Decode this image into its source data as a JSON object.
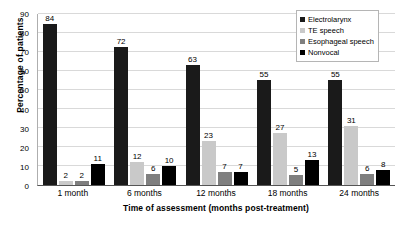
{
  "chart_data": {
    "type": "bar",
    "title": "",
    "xlabel": "Time of assessment (months post-treatment)",
    "ylabel": "Percentage of patients",
    "categories": [
      "1 month",
      "6 months",
      "12 months",
      "18 months",
      "24 months"
    ],
    "series": [
      {
        "name": "Electrolarynx",
        "color": "#1a1a1a",
        "values": [
          84,
          72,
          63,
          55,
          55
        ]
      },
      {
        "name": "TE speech",
        "color": "#c9c9c9",
        "values": [
          2,
          12,
          23,
          27,
          31
        ]
      },
      {
        "name": "Esophageal speech",
        "color": "#7f7f7f",
        "values": [
          2,
          6,
          7,
          5,
          6
        ]
      },
      {
        "name": "Nonvocal",
        "color": "#000000",
        "values": [
          11,
          10,
          7,
          13,
          8
        ]
      }
    ],
    "ylim": [
      0,
      90
    ],
    "yticks": [
      0,
      10,
      20,
      30,
      40,
      50,
      60,
      70,
      80,
      90
    ],
    "grid": true,
    "legend_position": "top-right",
    "data_labels": true
  }
}
